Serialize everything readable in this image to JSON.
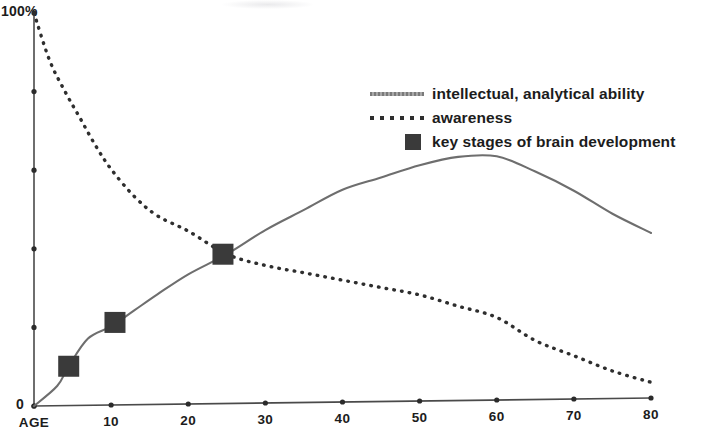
{
  "chart_data": {
    "type": "line",
    "title": "",
    "subtitle": "",
    "xlabel": "AGE",
    "ylabel": "",
    "xlim": [
      0,
      80
    ],
    "ylim": [
      0,
      100
    ],
    "grid": false,
    "legend_position": "upper right",
    "x_tick_labels": [
      "AGE",
      "10",
      "20",
      "30",
      "40",
      "50",
      "60",
      "70",
      "80"
    ],
    "x_tick_values": [
      0,
      10,
      20,
      30,
      40,
      50,
      60,
      70,
      80
    ],
    "y_tick_labels": [
      "100%",
      "",
      "",
      "",
      "",
      "0"
    ],
    "y_tick_values": [
      100,
      80,
      60,
      40,
      20,
      0
    ],
    "y_axis_top_label": "100%",
    "y_axis_bottom_label": "0",
    "series": [
      {
        "name": "intellectual, analytical ability",
        "style": "solid",
        "color": "#6e6e6e",
        "x": [
          0,
          3,
          4.5,
          7,
          10,
          13,
          16,
          20,
          25,
          30,
          35,
          40,
          45,
          50,
          55,
          60,
          65,
          70,
          75,
          80
        ],
        "values": [
          0,
          5,
          10,
          17,
          20,
          24,
          28,
          33,
          38,
          44,
          49,
          54,
          57,
          60,
          62,
          62,
          58,
          53,
          47,
          42
        ]
      },
      {
        "name": "awareness",
        "style": "dotted",
        "color": "#2e2e2e",
        "x": [
          0,
          2,
          4,
          6,
          8,
          10,
          13,
          16,
          20,
          25,
          30,
          35,
          40,
          45,
          50,
          55,
          60,
          65,
          70,
          75,
          80
        ],
        "values": [
          100,
          88,
          80,
          73,
          66,
          60,
          53,
          48,
          44,
          38,
          35,
          33,
          31,
          29,
          27,
          24,
          21,
          15,
          11,
          7,
          4
        ]
      }
    ],
    "markers": {
      "name": "key stages of brain development",
      "color": "#3a3a3a",
      "shape": "square",
      "points": [
        {
          "x": 4.5,
          "y": 10
        },
        {
          "x": 10.5,
          "y": 21
        },
        {
          "x": 24.5,
          "y": 38
        }
      ]
    }
  },
  "legend": {
    "items": [
      {
        "label": "intellectual, analytical ability",
        "swatch": "line-solid-swatch"
      },
      {
        "label": "awareness",
        "swatch": "line-dotted-swatch"
      },
      {
        "label": "key stages of brain development",
        "swatch": "square-swatch"
      }
    ]
  },
  "axes": {
    "y_top": "100%",
    "y_zero": "0",
    "x_labels": [
      "AGE",
      "10",
      "20",
      "30",
      "40",
      "50",
      "60",
      "70",
      "80"
    ]
  }
}
